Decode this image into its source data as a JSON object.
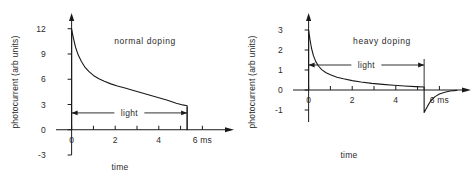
{
  "figure": {
    "background": "#ffffff",
    "ink": "#1a1a1a"
  },
  "chart_data": [
    {
      "type": "line",
      "panel": "left",
      "title": "normal doping",
      "xlabel": "time",
      "ylabel": "photocurrent (arb units)",
      "xunit": "6 ms",
      "xlim": [
        -0.9,
        6.9
      ],
      "ylim": [
        -3,
        12.8
      ],
      "xticks": [
        0,
        1,
        2,
        3,
        4,
        5,
        6
      ],
      "xticklabels": [
        "0",
        "",
        "2",
        "",
        "4",
        "",
        "6 ms"
      ],
      "yticks": [
        -3,
        0,
        3,
        6,
        9,
        12
      ],
      "yticklabels": [
        "-3",
        "0",
        "3",
        "6",
        "9",
        "12"
      ],
      "grid": false,
      "legend": "none",
      "annotation": {
        "text": "light",
        "x_start": 0,
        "x_end": 5.3,
        "y": 2.0,
        "style": "double-arrow"
      },
      "series": [
        {
          "name": "photocurrent",
          "x": [
            0,
            0,
            0.08,
            0.18,
            0.3,
            0.45,
            0.62,
            0.8,
            1.0,
            1.25,
            1.5,
            1.8,
            2.1,
            2.45,
            2.8,
            3.2,
            3.6,
            4.0,
            4.4,
            4.8,
            5.1,
            5.3,
            5.3
          ],
          "y": [
            0,
            12.0,
            10.9,
            9.8,
            8.9,
            8.1,
            7.4,
            6.9,
            6.45,
            6.05,
            5.75,
            5.45,
            5.2,
            4.95,
            4.7,
            4.4,
            4.1,
            3.8,
            3.5,
            3.15,
            2.95,
            2.85,
            0
          ]
        }
      ]
    },
    {
      "type": "line",
      "panel": "right",
      "title": "heavy doping",
      "xlabel": "time",
      "ylabel": "photocurrent (arb units)",
      "xunit": "6 ms",
      "xlim": [
        -0.9,
        6.9
      ],
      "ylim": [
        -1.6,
        3.4
      ],
      "xticks": [
        0,
        1,
        2,
        3,
        4,
        5,
        6
      ],
      "xticklabels": [
        "0",
        "",
        "2",
        "",
        "4",
        "",
        "6 ms"
      ],
      "yticks": [
        -1,
        0,
        1,
        2,
        3
      ],
      "yticklabels": [
        "-1",
        "0",
        "1",
        "2",
        "3"
      ],
      "grid": false,
      "legend": "none",
      "annotation": {
        "text": "light",
        "x_start": 0,
        "x_end": 5.3,
        "y": 1.25,
        "style": "double-arrow"
      },
      "series": [
        {
          "name": "photocurrent",
          "x": [
            0,
            0,
            0.06,
            0.13,
            0.22,
            0.33,
            0.45,
            0.6,
            0.8,
            1.0,
            1.3,
            1.6,
            2.0,
            2.4,
            2.9,
            3.4,
            3.9,
            4.4,
            4.9,
            5.3,
            5.3,
            5.45,
            5.6,
            5.8,
            6.0,
            6.25,
            6.5,
            6.8
          ],
          "y": [
            0,
            3.0,
            2.55,
            2.1,
            1.72,
            1.42,
            1.2,
            1.02,
            0.86,
            0.76,
            0.64,
            0.56,
            0.47,
            0.4,
            0.33,
            0.28,
            0.24,
            0.2,
            0.17,
            0.15,
            -1.12,
            -0.82,
            -0.55,
            -0.33,
            -0.2,
            -0.11,
            -0.05,
            -0.02
          ]
        }
      ]
    }
  ]
}
